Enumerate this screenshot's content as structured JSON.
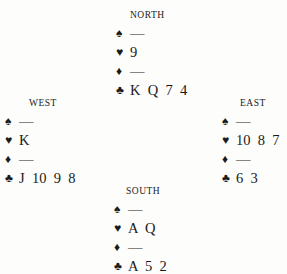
{
  "north": {
    "label": "NORTH",
    "spades": "—",
    "hearts": "9",
    "diamonds": "—",
    "clubs": "K  Q  7  4"
  },
  "west": {
    "label": "WEST",
    "spades": "—",
    "hearts": "K",
    "diamonds": "—",
    "clubs": "J  10  9  8"
  },
  "east": {
    "label": "EAST",
    "spades": "—",
    "hearts": "10  8  7",
    "diamonds": "—",
    "clubs": "6  3"
  },
  "south": {
    "label": "SOUTH",
    "spades": "—",
    "hearts": "A  Q",
    "diamonds": "—",
    "clubs": "A  5  2"
  },
  "suits": {
    "spades": "♠",
    "hearts": "♥",
    "diamonds": "♦",
    "clubs": "♣"
  }
}
